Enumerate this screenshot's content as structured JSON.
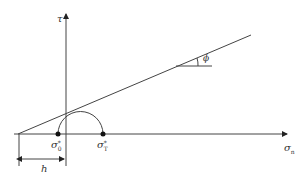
{
  "diagram": {
    "type": "Mohr-Coulomb failure envelope",
    "axes": {
      "x_label": "σ",
      "x_sub": "n",
      "y_label": "τ"
    },
    "points": [
      {
        "label": "σ",
        "sub": "0",
        "sup": "*"
      },
      {
        "label": "σ",
        "sub": "T",
        "sup": "*"
      }
    ],
    "angle_label": "ϕ",
    "dimension_label": "h",
    "colors": {
      "line": "#444444",
      "point": "#111111"
    }
  }
}
